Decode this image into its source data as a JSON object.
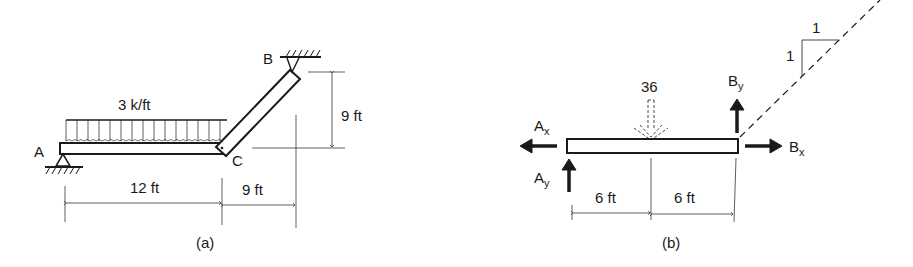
{
  "figure_a": {
    "caption": "(a)",
    "load_label": "3 k/ft",
    "point_A": "A",
    "point_B": "B",
    "point_C": "C",
    "dim_beam": "12 ft",
    "dim_horizontal_strut": "9 ft",
    "dim_vertical_strut": "9 ft"
  },
  "figure_b": {
    "caption": "(b)",
    "resultant_load": "36",
    "Ax": "A",
    "Ax_sub": "x",
    "Ay": "A",
    "Ay_sub": "y",
    "Bx": "B",
    "Bx_sub": "x",
    "By": "B",
    "By_sub": "y",
    "dim_left": "6 ft",
    "dim_right": "6 ft",
    "slope_rise": "1",
    "slope_run": "1"
  },
  "colors": {
    "ink": "#1a1a1a",
    "background": "#ffffff"
  }
}
